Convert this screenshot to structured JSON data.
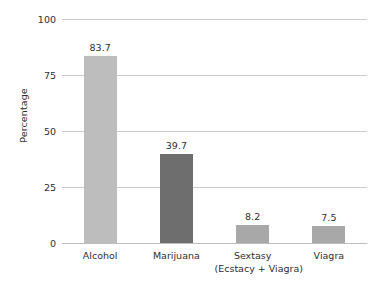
{
  "chart_data": {
    "type": "bar",
    "title": "",
    "xlabel": "",
    "ylabel": "Percentage",
    "ylim": [
      0,
      100
    ],
    "yticks": [
      0,
      25,
      50,
      75,
      100
    ],
    "ytick_labels": [
      "0",
      "25",
      "50",
      "75",
      "100"
    ],
    "grid": true,
    "legend": "none",
    "categories": [
      "Alcohol",
      "Marijuana",
      "Sextasy (Ecstacy + Viagra)",
      "Viagra"
    ],
    "values": [
      83.7,
      39.7,
      8.2,
      7.5
    ],
    "value_labels": [
      "83.7",
      "39.7",
      "8.2",
      "7.5"
    ],
    "bars": [
      {
        "category": "Alcohol",
        "label_line1": "Alcohol",
        "label_line2": "",
        "value": 83.7,
        "value_label": "83.7",
        "color": "#bdbdbd"
      },
      {
        "category": "Marijuana",
        "label_line1": "Marijuana",
        "label_line2": "",
        "value": 39.7,
        "value_label": "39.7",
        "color": "#6e6e6e"
      },
      {
        "category": "Sextasy (Ecstacy + Viagra)",
        "label_line1": "Sextasy",
        "label_line2": "(Ecstacy + Viagra)",
        "value": 8.2,
        "value_label": "8.2",
        "color": "#a8a8a8"
      },
      {
        "category": "Viagra",
        "label_line1": "Viagra",
        "label_line2": "",
        "value": 7.5,
        "value_label": "7.5",
        "color": "#a8a8a8"
      }
    ],
    "colors": {
      "background": "#ffffff",
      "gridline": "#c9c9c9",
      "baseline": "#bdbdbd",
      "text": "#2e2e2e"
    }
  }
}
